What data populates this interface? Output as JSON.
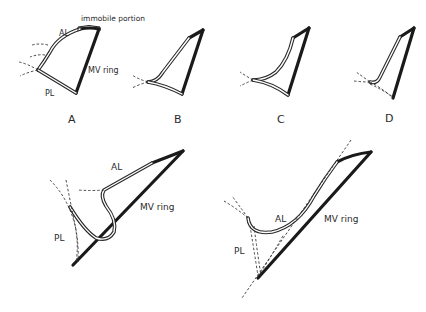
{
  "figure": {
    "panels_top": [
      {
        "id": "A",
        "label": "A"
      },
      {
        "id": "B",
        "label": "B"
      },
      {
        "id": "C",
        "label": "C"
      },
      {
        "id": "D",
        "label": "D"
      }
    ],
    "labels": {
      "immobile_portion": "immobile portion",
      "anterior_leaflet": "AL",
      "posterior_leaflet": "PL",
      "mitral_ring": "MV ring"
    },
    "panel_bottom_left": {
      "al": "AL",
      "pl": "PL",
      "ring": "MV ring"
    },
    "panel_bottom_right": {
      "al": "AL",
      "pl": "PL",
      "ring": "MV ring"
    },
    "colors": {
      "stroke": "#1a1a1a",
      "background": "#ffffff"
    }
  }
}
